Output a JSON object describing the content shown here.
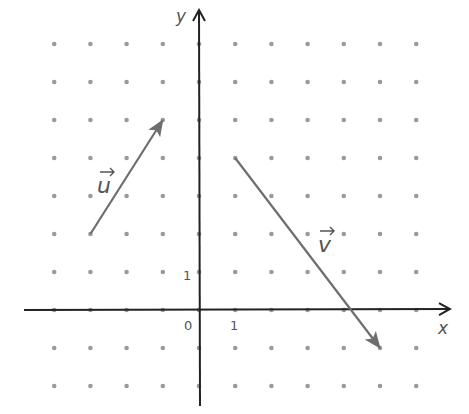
{
  "diagram": {
    "type": "vectors-on-dot-grid",
    "axes": {
      "x_label": "x",
      "y_label": "y",
      "origin_label": "0",
      "x_unit_label": "1",
      "y_unit_label": "1",
      "x_range": [
        -4,
        6
      ],
      "y_range": [
        -2,
        7
      ]
    },
    "vectors": [
      {
        "name": "u",
        "label": "u",
        "from": [
          -3,
          2
        ],
        "to": [
          -1,
          5
        ]
      },
      {
        "name": "v",
        "label": "v",
        "from": [
          1,
          4
        ],
        "to": [
          5,
          -1
        ]
      }
    ],
    "colors": {
      "axis": "#222222",
      "vector": "#6e6e6e",
      "dot": "#9a9a9a",
      "text": "#555555"
    }
  }
}
